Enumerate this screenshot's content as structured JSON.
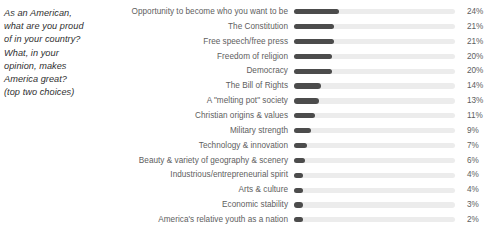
{
  "question": {
    "lines": [
      "As an American,",
      "what are you proud",
      "of in your country?",
      "What, in your",
      "opinion, makes",
      "America great?",
      "(top two choices)"
    ]
  },
  "axis": {
    "track_max_percent": 85
  },
  "colors": {
    "bar": "#4c4c4c",
    "track": "#ececec",
    "label_text": "#5e5e5e",
    "question_text": "#2f2f2f",
    "background": "#ffffff"
  },
  "chart_data": {
    "type": "bar",
    "orientation": "horizontal",
    "xlabel": "",
    "ylabel": "",
    "xlim": [
      0,
      85
    ],
    "grid": false,
    "legend": null,
    "value_suffix": "%",
    "categories": [
      "Opportunity to become who you want to be",
      "The Constitution",
      "Free speech/free press",
      "Freedom of religion",
      "Democracy",
      "The Bill of Rights",
      "A \"melting pot\" society",
      "Christian origins & values",
      "Military strength",
      "Technology & innovation",
      "Beauty & variety of geography & scenery",
      "Industrious/entrepreneurial spirit",
      "Arts & culture",
      "Economic stability",
      "America's relative youth as a nation"
    ],
    "values": [
      24,
      21,
      21,
      20,
      20,
      14,
      13,
      11,
      9,
      7,
      6,
      4,
      4,
      3,
      2
    ],
    "value_labels": [
      "24%",
      "21%",
      "21%",
      "20%",
      "20%",
      "14%",
      "13%",
      "11%",
      "9%",
      "7%",
      "6%",
      "4%",
      "4%",
      "3%",
      "2%"
    ]
  }
}
